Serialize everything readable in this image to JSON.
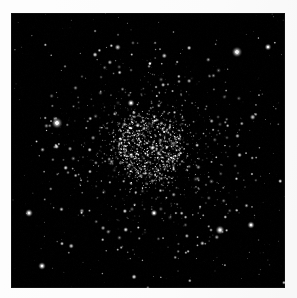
{
  "page": {
    "background_color": "#fdfdfd",
    "width": 297,
    "height": 298
  },
  "plate": {
    "name": "globular-cluster-photograph",
    "alt_text": "Black and white astronomical photograph of a globular star cluster",
    "background_color": "#020202",
    "frame": {
      "left": 11,
      "top": 13,
      "width": 274,
      "height": 275
    },
    "caption": ""
  },
  "chart_data": {
    "type": "scatter",
    "title": "",
    "xlabel": "",
    "ylabel": "",
    "xlim": [
      0,
      274
    ],
    "ylim": [
      0,
      275
    ],
    "grid": false,
    "legend": "none",
    "background": "#020202",
    "cluster": {
      "center_x": 139,
      "center_y": 135,
      "core_radius": 30,
      "half_light_radius": 48,
      "halo_radius": 115,
      "peak_brightness": 0.95
    },
    "field_star_count": 430,
    "cluster_star_count": 1500,
    "bright_field_stars": [
      {
        "x": 46,
        "y": 110,
        "r": 4.2,
        "b": 1.0
      },
      {
        "x": 226,
        "y": 39,
        "r": 4.0,
        "b": 0.98
      },
      {
        "x": 209,
        "y": 217,
        "r": 3.4,
        "b": 0.92
      },
      {
        "x": 18,
        "y": 200,
        "r": 3.0,
        "b": 0.9
      },
      {
        "x": 31,
        "y": 253,
        "r": 2.9,
        "b": 0.88
      },
      {
        "x": 240,
        "y": 212,
        "r": 2.8,
        "b": 0.86
      },
      {
        "x": 120,
        "y": 90,
        "r": 2.7,
        "b": 0.85
      },
      {
        "x": 257,
        "y": 34,
        "r": 2.6,
        "b": 0.84
      },
      {
        "x": 239,
        "y": 480,
        "r": 2.4,
        "b": 0.8
      },
      {
        "x": 143,
        "y": 200,
        "r": 2.6,
        "b": 0.84
      }
    ]
  }
}
